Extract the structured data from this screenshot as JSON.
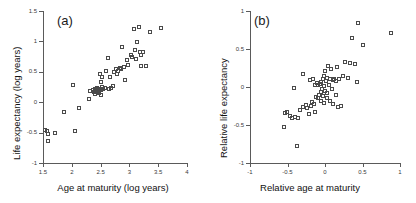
{
  "figure": {
    "background": "#ffffff",
    "marker_color": "#4a4a4a",
    "axis_color": "#5a5a5a"
  },
  "chart_data": [
    {
      "type": "scatter",
      "panel_label": "(a)",
      "title": "",
      "xlabel": "Age at maturity (log years)",
      "ylabel": "Life expectancy (log years)",
      "xlim": [
        1.5,
        4
      ],
      "ylim": [
        -1,
        1.5
      ],
      "xticks": [
        1.5,
        2,
        2.5,
        3,
        3.5,
        4
      ],
      "xticklabels": [
        "1.5",
        "2",
        "2.5",
        "3",
        "3.5",
        "4"
      ],
      "yticks": [
        -1,
        -0.5,
        0,
        0.5,
        1,
        1.5
      ],
      "yticklabels": [
        "-1",
        "-0.5",
        "0",
        "0.5",
        "1",
        "1.5"
      ],
      "grid": false,
      "legend": null,
      "marker": "open-square",
      "points": [
        [
          1.53,
          -0.46
        ],
        [
          1.57,
          -0.47
        ],
        [
          1.58,
          -0.53
        ],
        [
          1.59,
          -0.63
        ],
        [
          1.71,
          -0.5
        ],
        [
          1.86,
          -0.16
        ],
        [
          2.02,
          0.29
        ],
        [
          2.05,
          -0.47
        ],
        [
          2.13,
          -0.09
        ],
        [
          2.3,
          0.05
        ],
        [
          2.32,
          0.19
        ],
        [
          2.36,
          0.2
        ],
        [
          2.38,
          0.16
        ],
        [
          2.4,
          0.21
        ],
        [
          2.41,
          0.13
        ],
        [
          2.43,
          0.18
        ],
        [
          2.44,
          0.24
        ],
        [
          2.45,
          0.17
        ],
        [
          2.46,
          0.19
        ],
        [
          2.47,
          0.15
        ],
        [
          2.48,
          0.22
        ],
        [
          2.49,
          0.47
        ],
        [
          2.5,
          0.2
        ],
        [
          2.5,
          0.12
        ],
        [
          2.51,
          0.33
        ],
        [
          2.52,
          0.41
        ],
        [
          2.53,
          0.25
        ],
        [
          2.55,
          0.22
        ],
        [
          2.58,
          0.23
        ],
        [
          2.6,
          0.51
        ],
        [
          2.62,
          0.73
        ],
        [
          2.64,
          0.21
        ],
        [
          2.66,
          0.42
        ],
        [
          2.68,
          0.24
        ],
        [
          2.72,
          0.27
        ],
        [
          2.74,
          0.49
        ],
        [
          2.76,
          0.55
        ],
        [
          2.78,
          0.46
        ],
        [
          2.8,
          0.52
        ],
        [
          2.83,
          0.57
        ],
        [
          2.86,
          0.54
        ],
        [
          2.88,
          0.91
        ],
        [
          2.9,
          0.58
        ],
        [
          2.92,
          0.36
        ],
        [
          2.95,
          0.7
        ],
        [
          2.98,
          0.62
        ],
        [
          3.02,
          0.78
        ],
        [
          3.05,
          0.75
        ],
        [
          3.08,
          1.21
        ],
        [
          3.1,
          0.86
        ],
        [
          3.12,
          0.71
        ],
        [
          3.14,
          0.99
        ],
        [
          3.16,
          1.23
        ],
        [
          3.18,
          0.83
        ],
        [
          3.2,
          0.77
        ],
        [
          3.21,
          0.6
        ],
        [
          3.24,
          0.82
        ],
        [
          3.28,
          0.6
        ],
        [
          3.36,
          1.15
        ],
        [
          3.55,
          1.22
        ]
      ]
    },
    {
      "type": "scatter",
      "panel_label": "(b)",
      "title": "",
      "xlabel": "Relative age at maturity",
      "ylabel": "Relative life expectancy",
      "xlim": [
        -1,
        1
      ],
      "ylim": [
        -1,
        1
      ],
      "xticks": [
        -1,
        -0.5,
        0,
        0.5,
        1
      ],
      "xticklabels": [
        "-1",
        "-0.5",
        "0",
        "0.5",
        "1"
      ],
      "yticks": [
        -1,
        -0.5,
        0,
        0.5,
        1
      ],
      "yticklabels": [
        "-1",
        "-0.5",
        "0",
        "0.5",
        "1"
      ],
      "grid": false,
      "legend": null,
      "marker": "open-square",
      "points": [
        [
          -0.55,
          -0.53
        ],
        [
          -0.54,
          -0.34
        ],
        [
          -0.51,
          -0.33
        ],
        [
          -0.47,
          -0.38
        ],
        [
          -0.44,
          -0.41
        ],
        [
          -0.41,
          -0.01
        ],
        [
          -0.4,
          -0.4
        ],
        [
          -0.38,
          -0.77
        ],
        [
          -0.36,
          -0.41
        ],
        [
          -0.33,
          -0.3
        ],
        [
          -0.3,
          0.17
        ],
        [
          -0.29,
          -0.26
        ],
        [
          -0.26,
          -0.24
        ],
        [
          -0.24,
          -0.27
        ],
        [
          -0.22,
          -0.36
        ],
        [
          -0.2,
          0.09
        ],
        [
          -0.19,
          -0.25
        ],
        [
          -0.17,
          -0.2
        ],
        [
          -0.16,
          0.11
        ],
        [
          -0.15,
          -0.22
        ],
        [
          -0.14,
          -0.33
        ],
        [
          -0.13,
          0.03
        ],
        [
          -0.12,
          -0.13
        ],
        [
          -0.11,
          0.05
        ],
        [
          -0.1,
          -0.15
        ],
        [
          -0.09,
          0.02
        ],
        [
          -0.08,
          -0.1
        ],
        [
          -0.07,
          0.04
        ],
        [
          -0.06,
          -0.06
        ],
        [
          -0.05,
          0.06
        ],
        [
          -0.05,
          -0.18
        ],
        [
          -0.04,
          -0.02
        ],
        [
          -0.03,
          0.1
        ],
        [
          -0.03,
          -0.12
        ],
        [
          -0.02,
          0.01
        ],
        [
          -0.02,
          -0.21
        ],
        [
          -0.01,
          0.14
        ],
        [
          0.0,
          -0.05
        ],
        [
          0.0,
          0.21
        ],
        [
          0.01,
          0.08
        ],
        [
          0.02,
          -0.14
        ],
        [
          0.03,
          0.12
        ],
        [
          0.03,
          -0.08
        ],
        [
          0.04,
          0.27
        ],
        [
          0.05,
          0.02
        ],
        [
          0.06,
          -0.19
        ],
        [
          0.07,
          0.1
        ],
        [
          0.08,
          0.24
        ],
        [
          0.09,
          -0.03
        ],
        [
          0.1,
          0.09
        ],
        [
          0.11,
          -0.22
        ],
        [
          0.12,
          0.11
        ],
        [
          0.14,
          -0.11
        ],
        [
          0.15,
          0.08
        ],
        [
          0.16,
          0.26
        ],
        [
          0.17,
          -0.26
        ],
        [
          0.19,
          0.1
        ],
        [
          0.21,
          -0.25
        ],
        [
          0.24,
          0.14
        ],
        [
          0.27,
          0.33
        ],
        [
          0.3,
          0.12
        ],
        [
          0.33,
          0.31
        ],
        [
          0.36,
          0.65
        ],
        [
          0.4,
          0.3
        ],
        [
          0.42,
          0.07
        ],
        [
          0.44,
          0.84
        ],
        [
          0.5,
          0.55
        ],
        [
          0.88,
          0.71
        ]
      ]
    }
  ]
}
